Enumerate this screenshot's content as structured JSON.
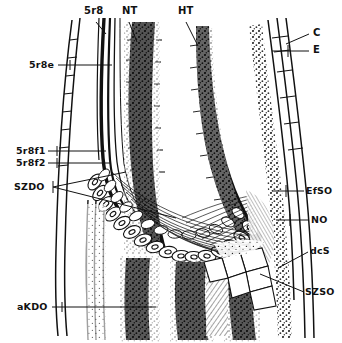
{
  "figure": {
    "background_color": "#ffffff",
    "ink_color": "#111111",
    "width": 342,
    "height": 343
  },
  "labels": {
    "top": [
      {
        "id": "label-5r8",
        "text": "5r8",
        "x": 84,
        "y": 11
      },
      {
        "id": "label-nt",
        "text": "NT",
        "x": 122,
        "y": 11
      },
      {
        "id": "label-ht",
        "text": "HT",
        "x": 178,
        "y": 11
      }
    ],
    "left": [
      {
        "id": "label-5r8e",
        "text": "5r8e",
        "x": 29,
        "y": 59
      },
      {
        "id": "label-5r8f1",
        "text": "5r8f1",
        "x": 16,
        "y": 144
      },
      {
        "id": "label-5r8f2",
        "text": "5r8f2",
        "x": 16,
        "y": 157
      },
      {
        "id": "label-szdo",
        "text": "SZDO",
        "x": 16,
        "y": 181
      },
      {
        "id": "label-akdo",
        "text": "aKDO",
        "x": 19,
        "y": 301
      }
    ],
    "right": [
      {
        "id": "label-c",
        "text": "C",
        "x": 313,
        "y": 29
      },
      {
        "id": "label-e",
        "text": "E",
        "x": 313,
        "y": 46
      },
      {
        "id": "label-efso",
        "text": "EfSO",
        "x": 308,
        "y": 186
      },
      {
        "id": "label-no",
        "text": "NO",
        "x": 312,
        "y": 215
      },
      {
        "id": "label-dcs",
        "text": "dcS",
        "x": 311,
        "y": 246
      },
      {
        "id": "label-szso",
        "text": "SZSO",
        "x": 308,
        "y": 287
      }
    ]
  },
  "leaders": {
    "note": "leader lines connecting each abbreviation to its structure"
  }
}
